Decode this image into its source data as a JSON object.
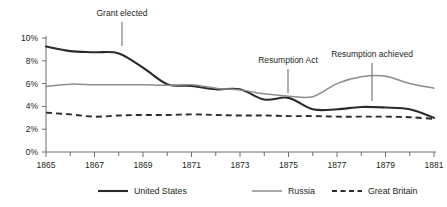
{
  "chart_data": {
    "type": "line",
    "title": "",
    "subtitle": "",
    "xlabel": "",
    "ylabel": "",
    "xlim": [
      1865,
      1881
    ],
    "ylim": [
      0,
      10
    ],
    "grid": false,
    "legend_position": "bottom",
    "y_ticks": [
      "0%",
      "2%",
      "4%",
      "6%",
      "8%",
      "10%"
    ],
    "y_tick_values": [
      0,
      2,
      4,
      6,
      8,
      10
    ],
    "x_ticks": [
      "1865",
      "1867",
      "1869",
      "1871",
      "1873",
      "1875",
      "1877",
      "1879",
      "1881"
    ],
    "x_tick_values": [
      1865,
      1867,
      1869,
      1871,
      1873,
      1875,
      1877,
      1879,
      1881
    ],
    "x_minor_ticks": [
      1866,
      1868,
      1870,
      1872,
      1874,
      1876,
      1878,
      1880
    ],
    "x": [
      1865,
      1866,
      1867,
      1868,
      1869,
      1870,
      1871,
      1872,
      1873,
      1874,
      1875,
      1876,
      1877,
      1878,
      1879,
      1880,
      1881
    ],
    "series": [
      {
        "name": "United States",
        "style": "solid",
        "color": "#2b2b2b",
        "values": [
          9.25,
          8.85,
          8.75,
          8.65,
          7.4,
          5.95,
          5.8,
          5.5,
          5.5,
          4.6,
          4.75,
          3.75,
          3.75,
          3.95,
          3.9,
          3.75,
          3.0
        ]
      },
      {
        "name": "Russia",
        "style": "solid",
        "color": "#8d8d8d",
        "values": [
          5.75,
          5.95,
          5.9,
          5.9,
          5.9,
          5.85,
          5.9,
          5.6,
          5.45,
          5.1,
          4.9,
          4.85,
          6.0,
          6.6,
          6.65,
          6.0,
          5.6
        ]
      },
      {
        "name": "Great Britain",
        "style": "dashed",
        "color": "#2b2b2b",
        "values": [
          3.45,
          3.3,
          3.1,
          3.2,
          3.25,
          3.25,
          3.3,
          3.25,
          3.2,
          3.2,
          3.15,
          3.15,
          3.1,
          3.1,
          3.1,
          3.05,
          2.9
        ]
      }
    ],
    "annotations": [
      {
        "text": "Grant elected",
        "x": 1868,
        "label_x": 122,
        "label_y": 16,
        "rule_top": 22,
        "rule_bottom": 46
      },
      {
        "text": "Resumption Act",
        "x": 1875,
        "label_x": 288,
        "label_y": 63,
        "rule_top": 69,
        "rule_bottom": 93
      },
      {
        "text": "Resumption achieved",
        "x": 1879,
        "label_x": 372,
        "label_y": 57,
        "rule_top": 63,
        "rule_bottom": 101
      }
    ]
  },
  "legend": {
    "items": [
      {
        "label": "United States"
      },
      {
        "label": "Russia"
      },
      {
        "label": "Great Britain"
      }
    ]
  }
}
